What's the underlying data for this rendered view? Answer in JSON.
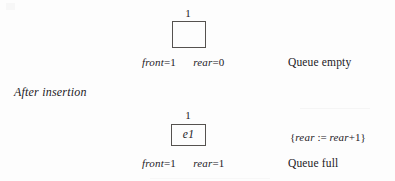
{
  "figure": {
    "background_color": "#fdfdfd",
    "ink_color": "#23201e",
    "box_border_color": "#55524f"
  },
  "section_label": "After insertion",
  "states": [
    {
      "id": "empty-state",
      "index_label": "1",
      "cell_content": "",
      "front_name": "front",
      "front_eq": "=",
      "front_value": "1",
      "rear_name": "rear",
      "rear_eq": "=",
      "rear_value": "0",
      "caption": "Queue empty",
      "annotation": null
    },
    {
      "id": "full-state",
      "index_label": "1",
      "cell_content": "e1",
      "front_name": "front",
      "front_eq": "=",
      "front_value": "1",
      "rear_name": "rear",
      "rear_eq": "=",
      "rear_value": "1",
      "caption": "Queue full",
      "annotation": {
        "open_brace": "{",
        "lhs": "rear",
        "operator": ":=",
        "rhs_var": "rear",
        "rhs_op": "+",
        "rhs_value": "1",
        "close_brace": "}"
      }
    }
  ]
}
